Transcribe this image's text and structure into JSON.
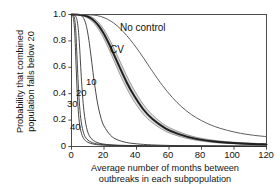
{
  "chart_data": {
    "type": "line",
    "title": "",
    "xlabel": "Average number of months between outbreaks in each subpopulation",
    "xlabel_line1": "Average number of months between",
    "xlabel_line2": "outbreaks in each subpopulation",
    "ylabel": "Probability that combined population falls below 20",
    "ylabel_line1": "Probability that combined",
    "ylabel_line2": "population falls below 20",
    "xlim": [
      0,
      120
    ],
    "ylim": [
      0,
      1.0
    ],
    "xticks": [
      0,
      20,
      40,
      60,
      80,
      100,
      120
    ],
    "xtick_labels": [
      "0",
      "20",
      "40",
      "60",
      "80",
      "100",
      "120"
    ],
    "yticks": [
      0,
      0.2,
      0.4,
      0.6,
      0.8,
      1.0
    ],
    "ytick_labels": [
      "0",
      "0.2",
      "0.4",
      "0.6",
      "0.8",
      "1.0"
    ],
    "grid": false,
    "legend_position": "inline-annotations",
    "annotations": [
      {
        "text": "No control",
        "x": 46,
        "y": 0.82
      },
      {
        "text": "CV",
        "x": 36,
        "y": 0.66
      },
      {
        "text": "10",
        "x": 13,
        "y": 0.5
      },
      {
        "text": "20",
        "x": 7,
        "y": 0.38
      },
      {
        "text": "30",
        "x": 3,
        "y": 0.29
      },
      {
        "text": "40",
        "x": 4,
        "y": 0.12
      }
    ],
    "series": [
      {
        "name": "No control",
        "color": "#555555",
        "x": [
          0,
          5,
          10,
          14,
          18,
          22,
          26,
          30,
          34,
          38,
          42,
          46,
          50,
          56,
          62,
          68,
          74,
          80,
          88,
          96,
          104,
          112,
          120
        ],
        "values": [
          1.0,
          1.0,
          0.998,
          0.995,
          0.985,
          0.965,
          0.935,
          0.893,
          0.84,
          0.78,
          0.712,
          0.64,
          0.566,
          0.462,
          0.372,
          0.298,
          0.24,
          0.196,
          0.152,
          0.122,
          0.1,
          0.085,
          0.075
        ]
      },
      {
        "name": "CV band upper",
        "color": "#9a9a9a",
        "x": [
          0,
          4,
          8,
          11,
          14,
          17,
          20,
          23,
          26,
          30,
          34,
          38,
          44,
          50,
          58,
          66,
          76,
          88,
          100,
          112,
          120
        ],
        "values": [
          1.0,
          1.0,
          0.996,
          0.988,
          0.968,
          0.935,
          0.885,
          0.82,
          0.745,
          0.64,
          0.535,
          0.44,
          0.322,
          0.236,
          0.158,
          0.112,
          0.072,
          0.046,
          0.032,
          0.024,
          0.02
        ]
      },
      {
        "name": "CV band center",
        "color": "#1f1f1f",
        "x": [
          0,
          4,
          8,
          11,
          14,
          17,
          20,
          23,
          26,
          30,
          34,
          38,
          44,
          50,
          58,
          66,
          76,
          88,
          100,
          112,
          120
        ],
        "values": [
          1.0,
          0.999,
          0.992,
          0.978,
          0.952,
          0.91,
          0.852,
          0.78,
          0.7,
          0.59,
          0.485,
          0.395,
          0.284,
          0.206,
          0.136,
          0.094,
          0.06,
          0.038,
          0.026,
          0.019,
          0.016
        ]
      },
      {
        "name": "CV band lower",
        "color": "#9a9a9a",
        "x": [
          0,
          4,
          8,
          11,
          14,
          17,
          20,
          23,
          26,
          30,
          34,
          38,
          44,
          50,
          58,
          66,
          76,
          88,
          100,
          112,
          120
        ],
        "values": [
          1.0,
          0.998,
          0.986,
          0.966,
          0.932,
          0.882,
          0.816,
          0.738,
          0.655,
          0.542,
          0.44,
          0.352,
          0.248,
          0.178,
          0.115,
          0.078,
          0.049,
          0.03,
          0.021,
          0.015,
          0.012
        ]
      },
      {
        "name": "10",
        "color": "#333333",
        "x": [
          0,
          2,
          4,
          6,
          7,
          8,
          9,
          10,
          11,
          12,
          13,
          14,
          16,
          18,
          20,
          24,
          28,
          34,
          42,
          52,
          64,
          80,
          100,
          120
        ],
        "values": [
          1.0,
          1.0,
          0.998,
          0.99,
          0.98,
          0.958,
          0.92,
          0.86,
          0.78,
          0.685,
          0.585,
          0.49,
          0.33,
          0.222,
          0.155,
          0.085,
          0.052,
          0.03,
          0.018,
          0.011,
          0.007,
          0.005,
          0.003,
          0.002
        ]
      },
      {
        "name": "20",
        "color": "#333333",
        "x": [
          0,
          1,
          2,
          3,
          3.6,
          4.2,
          4.8,
          5.4,
          6,
          6.8,
          7.6,
          8.6,
          10,
          12,
          15,
          19,
          25,
          34,
          48,
          70,
          95,
          120
        ],
        "values": [
          1.0,
          1.0,
          0.995,
          0.975,
          0.945,
          0.885,
          0.79,
          0.665,
          0.53,
          0.385,
          0.275,
          0.185,
          0.11,
          0.062,
          0.034,
          0.02,
          0.012,
          0.008,
          0.005,
          0.003,
          0.002,
          0.002
        ]
      },
      {
        "name": "30",
        "color": "#333333",
        "x": [
          0,
          0.8,
          1.5,
          2.0,
          2.4,
          2.8,
          3.2,
          3.7,
          4.3,
          5.0,
          6.0,
          7.5,
          9.5,
          13,
          18,
          26,
          40,
          60,
          90,
          120
        ],
        "values": [
          1.0,
          0.998,
          0.985,
          0.96,
          0.915,
          0.84,
          0.73,
          0.59,
          0.44,
          0.305,
          0.185,
          0.1,
          0.055,
          0.028,
          0.016,
          0.009,
          0.005,
          0.003,
          0.002,
          0.002
        ]
      },
      {
        "name": "40",
        "color": "#333333",
        "x": [
          0,
          0.6,
          1.1,
          1.5,
          1.9,
          2.3,
          2.7,
          3.2,
          3.8,
          4.6,
          5.8,
          7.5,
          10,
          14,
          20,
          30,
          45,
          70,
          95,
          120
        ],
        "values": [
          1.0,
          0.995,
          0.975,
          0.94,
          0.878,
          0.78,
          0.65,
          0.495,
          0.345,
          0.21,
          0.115,
          0.06,
          0.032,
          0.017,
          0.01,
          0.006,
          0.004,
          0.002,
          0.002,
          0.001
        ]
      }
    ]
  },
  "axes": {
    "frame_color": "#3a3a3a"
  }
}
